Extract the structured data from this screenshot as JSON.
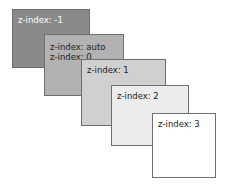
{
  "diagram": {
    "boxes": [
      {
        "lines": [
          "z-index: -1"
        ],
        "fill": "#8a8a8a",
        "text_color": "#ffffff"
      },
      {
        "lines": [
          "z-index: auto",
          "z-index: 0"
        ],
        "fill": "#b2b2b2",
        "text_color": "#222222"
      },
      {
        "lines": [
          "z-index: 1"
        ],
        "fill": "#d0d0d0",
        "text_color": "#222222"
      },
      {
        "lines": [
          "z-index: 2"
        ],
        "fill": "#ececec",
        "text_color": "#222222"
      },
      {
        "lines": [
          "z-index: 3"
        ],
        "fill": "#ffffff",
        "text_color": "#222222"
      }
    ]
  }
}
